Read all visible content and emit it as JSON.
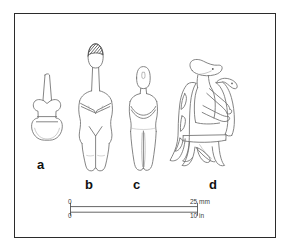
{
  "plate": {
    "title": "Cycladic figurine plate",
    "background_color": "#ffffff",
    "frame_color": "#2b2b2b",
    "line_color": "#6f6f6f",
    "label_color": "#111111"
  },
  "figures": [
    {
      "id": "a",
      "label": "a",
      "name": "violin-shaped-figurine",
      "description": "Schematic violin-shaped figurine with long tapering neck"
    },
    {
      "id": "b",
      "label": "b",
      "name": "female-figurine",
      "description": "Standing female figurine with long neck, shaded crown, folded arms"
    },
    {
      "id": "c",
      "label": "c",
      "name": "standing-figurine",
      "description": "Standing figurine with rectangular head and folded arms"
    },
    {
      "id": "d",
      "label": "d",
      "name": "seated-harp-player",
      "description": "Seated harp player on a high-backed chair"
    }
  ],
  "scale_bar": {
    "name": "scale-bar",
    "top_axis": {
      "start_label": "0",
      "end_label": "25  mm",
      "unit": "mm",
      "start_value": 0,
      "end_value": 25
    },
    "bottom_axis": {
      "start_label": "0",
      "end_label": "10  in",
      "unit": "in",
      "start_value": 0,
      "end_value": 10
    }
  },
  "caption": {
    "text": ""
  }
}
